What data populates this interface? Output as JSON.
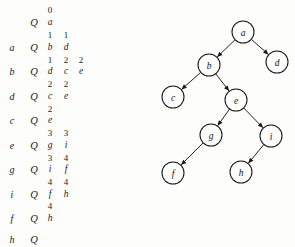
{
  "figure": {
    "background_color": "#fdfdfc",
    "ink_color": "#171717"
  },
  "trace_table": {
    "columns": [
      "vertex",
      "queue_marker",
      "stack_col_1",
      "stack_col_2",
      "stack_col_3"
    ],
    "rows": [
      {
        "type": "numbers",
        "y": 10,
        "vertex": "",
        "marker": "",
        "values": [
          "0"
        ]
      },
      {
        "type": "letters",
        "y": 23,
        "vertex": "",
        "marker": "Q",
        "values": [
          "a"
        ]
      },
      {
        "type": "numbers",
        "y": 35,
        "vertex": "",
        "marker": "",
        "values": [
          "1",
          "1"
        ]
      },
      {
        "type": "letters",
        "y": 48,
        "vertex": "a",
        "marker": "Q",
        "values": [
          "b",
          "d"
        ]
      },
      {
        "type": "numbers",
        "y": 60,
        "vertex": "",
        "marker": "",
        "values": [
          "1",
          "2",
          "2"
        ]
      },
      {
        "type": "letters",
        "y": 72,
        "vertex": "b",
        "marker": "Q",
        "values": [
          "d",
          "c",
          "e"
        ]
      },
      {
        "type": "numbers",
        "y": 84,
        "vertex": "",
        "marker": "",
        "values": [
          "2",
          "2"
        ]
      },
      {
        "type": "letters",
        "y": 97,
        "vertex": "d",
        "marker": "Q",
        "values": [
          "c",
          "e"
        ]
      },
      {
        "type": "numbers",
        "y": 109,
        "vertex": "",
        "marker": "",
        "values": [
          "2"
        ]
      },
      {
        "type": "letters",
        "y": 121,
        "vertex": "c",
        "marker": "Q",
        "values": [
          "e"
        ]
      },
      {
        "type": "numbers",
        "y": 133,
        "vertex": "",
        "marker": "",
        "values": [
          "3",
          "3"
        ]
      },
      {
        "type": "letters",
        "y": 146,
        "vertex": "e",
        "marker": "Q",
        "values": [
          "g",
          "i"
        ]
      },
      {
        "type": "numbers",
        "y": 158,
        "vertex": "",
        "marker": "",
        "values": [
          "3",
          "4"
        ]
      },
      {
        "type": "letters",
        "y": 170,
        "vertex": "g",
        "marker": "Q",
        "values": [
          "i",
          "f"
        ]
      },
      {
        "type": "numbers",
        "y": 182,
        "vertex": "",
        "marker": "",
        "values": [
          "4",
          "4"
        ]
      },
      {
        "type": "letters",
        "y": 195,
        "vertex": "i",
        "marker": "Q",
        "values": [
          "f",
          "h"
        ]
      },
      {
        "type": "numbers",
        "y": 206,
        "vertex": "",
        "marker": "",
        "values": [
          "4"
        ]
      },
      {
        "type": "letters",
        "y": 219,
        "vertex": "f",
        "marker": "Q",
        "values": [
          "h"
        ]
      },
      {
        "type": "letters",
        "y": 240,
        "vertex": "h",
        "marker": "Q",
        "values": []
      }
    ],
    "column_x": {
      "vertex": 12,
      "marker": 34,
      "v0": 50,
      "v1": 66,
      "v2": 81
    }
  },
  "tree": {
    "node_radius": 11,
    "nodes": [
      {
        "id": "a",
        "label": "a",
        "x": 93,
        "y": 32
      },
      {
        "id": "b",
        "label": "b",
        "x": 59,
        "y": 65
      },
      {
        "id": "d",
        "label": "d",
        "x": 127,
        "y": 62
      },
      {
        "id": "c",
        "label": "c",
        "x": 23,
        "y": 97
      },
      {
        "id": "e",
        "label": "e",
        "x": 86,
        "y": 100
      },
      {
        "id": "g",
        "label": "g",
        "x": 61,
        "y": 135
      },
      {
        "id": "i",
        "label": "i",
        "x": 121,
        "y": 136
      },
      {
        "id": "f",
        "label": "f",
        "x": 23,
        "y": 173
      },
      {
        "id": "h",
        "label": "h",
        "x": 91,
        "y": 172
      }
    ],
    "edges": [
      {
        "from": "a",
        "to": "b",
        "directed": true
      },
      {
        "from": "a",
        "to": "d",
        "directed": true
      },
      {
        "from": "b",
        "to": "c",
        "directed": true
      },
      {
        "from": "b",
        "to": "e",
        "directed": true
      },
      {
        "from": "e",
        "to": "g",
        "directed": true
      },
      {
        "from": "e",
        "to": "i",
        "directed": true
      },
      {
        "from": "g",
        "to": "f",
        "directed": true
      },
      {
        "from": "i",
        "to": "h",
        "directed": true
      }
    ]
  }
}
